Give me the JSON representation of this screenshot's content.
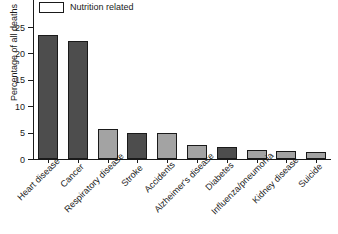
{
  "chart_data": {
    "type": "bar",
    "title": "",
    "xlabel": "",
    "ylabel": "Percentage of all deaths",
    "ylim": [
      0,
      25
    ],
    "yticks": [
      0,
      5,
      10,
      15,
      20,
      25
    ],
    "grid": false,
    "legend": {
      "position": "top-left",
      "entries": [
        {
          "label": "Nutrition related",
          "color": "#4d4d4d"
        }
      ]
    },
    "categories": [
      "Heart disease",
      "Cancer",
      "Respiratory disease",
      "Stroke",
      "Accidents",
      "Alzheimer's disease",
      "Diabetes",
      "Influenza/pneumonia",
      "Kidney disease",
      "Suicide"
    ],
    "values": [
      23.5,
      22.3,
      5.6,
      4.9,
      4.9,
      2.7,
      2.2,
      1.8,
      1.5,
      1.3
    ],
    "nutrition_related": [
      true,
      true,
      false,
      true,
      false,
      false,
      true,
      false,
      false,
      false
    ],
    "colors": {
      "nutrition_related": "#4d4d4d",
      "other": "#a3a3a3",
      "axis": "#1a1a1a",
      "background": "#ffffff"
    }
  }
}
